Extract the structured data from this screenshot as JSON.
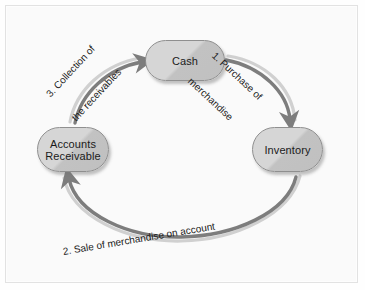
{
  "diagram": {
    "nodes": [
      {
        "id": "cash",
        "label": "Cash"
      },
      {
        "id": "accounts-receivable",
        "label_line1": "Accounts",
        "label_line2": "Receivable"
      },
      {
        "id": "inventory",
        "label": "Inventory"
      }
    ],
    "arrows": [
      {
        "id": "purchase",
        "from": "cash",
        "to": "inventory",
        "label_line1": "1. Purchase of",
        "label_line2": "merchandise"
      },
      {
        "id": "sale",
        "from": "inventory",
        "to": "accounts-receivable",
        "label": "2. Sale of merchandise on account"
      },
      {
        "id": "collection",
        "from": "accounts-receivable",
        "to": "cash",
        "label_line1": "3. Collection of",
        "label_line2": "the receivables"
      }
    ],
    "colors": {
      "node_fill_light": "#d6d6d6",
      "node_fill_dark": "#c0c0c0",
      "node_border": "#8f8f8f",
      "arrow_stroke": "#7d7d7d",
      "arrow_highlight": "#d3d3d3",
      "background": "#fafafa",
      "frame_border": "#e2e2e2",
      "text": "#1a1a1a"
    }
  }
}
